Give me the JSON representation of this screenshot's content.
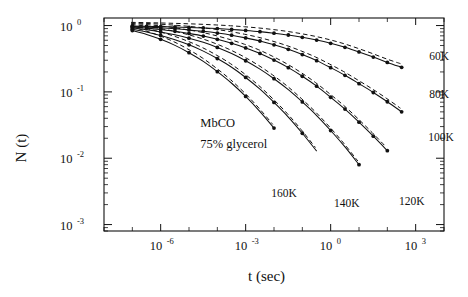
{
  "figure": {
    "title_annotations": [
      "MbCO",
      "75% glycerol"
    ],
    "sample_label": "MbCO",
    "solvent_label": "75% glycerol"
  },
  "chart_data": {
    "type": "line",
    "title": "",
    "xlabel": "t (sec)",
    "ylabel": "N (t)",
    "xscale": "log",
    "yscale": "log",
    "xlim": [
      1e-08,
      10000.0
    ],
    "ylim": [
      0.0008,
      1.3
    ],
    "grid": false,
    "legend_position": "inline-right",
    "xticks": [
      {
        "value": 1e-06,
        "label": "10",
        "exponent": "-6"
      },
      {
        "value": 0.001,
        "label": "10",
        "exponent": "-3"
      },
      {
        "value": 1.0,
        "label": "10",
        "exponent": "0"
      },
      {
        "value": 1000.0,
        "label": "10",
        "exponent": "3"
      }
    ],
    "yticks": [
      {
        "value": 1.0,
        "label": "10",
        "exponent": "0"
      },
      {
        "value": 0.1,
        "label": "10",
        "exponent": "-1"
      },
      {
        "value": 0.01,
        "label": "10",
        "exponent": "-2"
      },
      {
        "value": 0.001,
        "label": "10",
        "exponent": "-3"
      }
    ],
    "series": [
      {
        "name": "60K",
        "label": "60K",
        "label_x": 3000.0,
        "label_y": 0.3,
        "x": [
          1e-07,
          3.2e-07,
          1e-06,
          3.2e-06,
          1e-05,
          3.2e-05,
          0.0001,
          0.00032,
          0.001,
          0.0032,
          0.01,
          0.032,
          0.1,
          0.32,
          1.0,
          3.2,
          10.0,
          32.0,
          100.0,
          320.0
        ],
        "y": [
          0.985,
          0.975,
          0.965,
          0.952,
          0.938,
          0.92,
          0.9,
          0.875,
          0.845,
          0.81,
          0.768,
          0.72,
          0.665,
          0.605,
          0.54,
          0.47,
          0.4,
          0.335,
          0.278,
          0.235
        ]
      },
      {
        "name": "80K",
        "label": "80K",
        "label_x": 3000.0,
        "label_y": 0.082,
        "x": [
          1e-07,
          3.2e-07,
          1e-06,
          3.2e-06,
          1e-05,
          3.2e-05,
          0.0001,
          0.00032,
          0.001,
          0.0032,
          0.01,
          0.032,
          0.1,
          0.32,
          1.0,
          3.2,
          10.0,
          32.0,
          100.0,
          320.0
        ],
        "y": [
          0.97,
          0.95,
          0.925,
          0.895,
          0.86,
          0.818,
          0.77,
          0.715,
          0.652,
          0.585,
          0.512,
          0.438,
          0.365,
          0.296,
          0.232,
          0.178,
          0.133,
          0.098,
          0.071,
          0.05
        ]
      },
      {
        "name": "100K",
        "label": "100K",
        "label_x": 2800.0,
        "label_y": 0.0185,
        "x": [
          1e-07,
          3.2e-07,
          1e-06,
          3.2e-06,
          1e-05,
          3.2e-05,
          0.0001,
          0.00032,
          0.001,
          0.0032,
          0.01,
          0.032,
          0.1,
          0.32,
          1.0,
          3.2,
          10.0,
          32.0,
          100.0
        ],
        "y": [
          0.95,
          0.915,
          0.872,
          0.82,
          0.76,
          0.695,
          0.62,
          0.54,
          0.46,
          0.38,
          0.302,
          0.232,
          0.172,
          0.122,
          0.083,
          0.055,
          0.035,
          0.0215,
          0.013
        ]
      },
      {
        "name": "120K",
        "label": "120K",
        "label_x": 260.0,
        "label_y": 0.00195,
        "x": [
          1e-07,
          3.2e-07,
          1e-06,
          3.2e-06,
          1e-05,
          3.2e-05,
          0.0001,
          0.00032,
          0.001,
          0.0032,
          0.01,
          0.032,
          0.1,
          0.32,
          1.0,
          3.2,
          10.0
        ],
        "y": [
          0.92,
          0.865,
          0.8,
          0.725,
          0.645,
          0.558,
          0.468,
          0.378,
          0.295,
          0.22,
          0.158,
          0.108,
          0.0705,
          0.044,
          0.0262,
          0.0148,
          0.008
        ]
      },
      {
        "name": "140K",
        "label": "140K",
        "label_x": 1.3,
        "label_y": 0.00185,
        "x": [
          1e-07,
          3.2e-07,
          1e-06,
          3.2e-06,
          1e-05,
          3.2e-05,
          0.0001,
          0.00032,
          0.001,
          0.0032,
          0.01,
          0.032,
          0.1,
          0.32
        ],
        "y": [
          0.88,
          0.8,
          0.71,
          0.612,
          0.512,
          0.412,
          0.318,
          0.235,
          0.165,
          0.11,
          0.0695,
          0.0418,
          0.0238,
          0.0128
        ]
      },
      {
        "name": "160K",
        "label": "160K",
        "label_x": 0.008,
        "label_y": 0.0026,
        "x": [
          1e-07,
          3.2e-07,
          1e-06,
          3.2e-06,
          1e-05,
          3.2e-05,
          0.0001,
          0.00032,
          0.001,
          0.0032,
          0.01
        ],
        "y": [
          0.84,
          0.735,
          0.62,
          0.503,
          0.39,
          0.288,
          0.202,
          0.135,
          0.0855,
          0.0505,
          0.0285
        ]
      }
    ],
    "dashed_overlay": {
      "description": "dashed companion curve drawn slightly above each solid fit",
      "offset_log_y": 0.055
    },
    "annotations": [
      {
        "text": "MbCO",
        "x": 2.5e-05,
        "y": 0.03
      },
      {
        "text": "75% glycerol",
        "x": 2.5e-05,
        "y": 0.0145
      }
    ]
  }
}
